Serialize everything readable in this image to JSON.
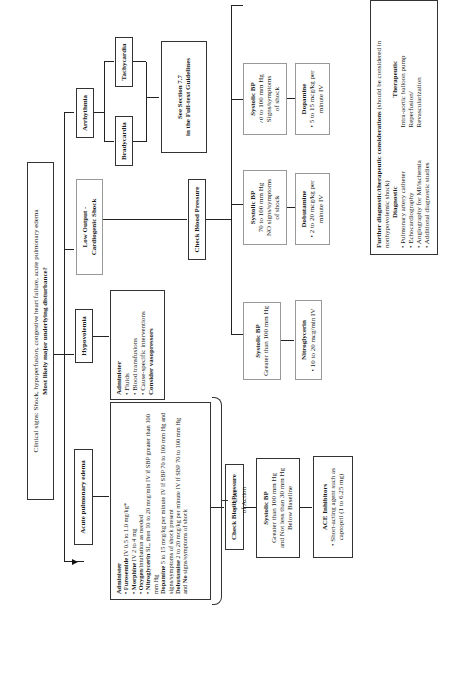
{
  "clinical_signs": {
    "line1": "Clinical signs: Shock, hypoperfusion, congestive heart failure, acute pulmonary edema",
    "line2": "Most likely major underlying disturbance?"
  },
  "branches": {
    "acute_pulmonary_edema": "Acute pulmonary edema",
    "hypovolemia": "Hypovolemia",
    "low_output": {
      "line1": "Low Output -",
      "line2": "Cardiogenic Shock"
    },
    "arrhythmia": "Arrhythmia",
    "bradycardia": "Bradycardia",
    "tachycardia": "Tachycardia",
    "see_section": {
      "line1": "See Section 7.7",
      "line2": "in the Full-text Guidelines"
    }
  },
  "hypovolemia_admin": {
    "title": "Administer",
    "items": [
      "Fluids",
      "Blood transfusions",
      "Cause-specific interventions"
    ],
    "consider": "Consider vasopressors"
  },
  "ape_admin": {
    "title": "Administer",
    "items": [
      {
        "bold": "Furosemide",
        "text": " IV 0.5 to 1.0 mg/kg*"
      },
      {
        "bold": "Morphine",
        "text": " IV 2 to 4 mg"
      },
      {
        "bold": "Oxygen",
        "text": "/intubation as needed"
      },
      {
        "bold": "Nitroglycerin",
        "text": " SL, then 10 to 20 mcg/min IV if SBP greater than 100 mm Hg"
      }
    ],
    "dopamine": {
      "bold": "Dopamine",
      "text": " 5 to 15 mcg/kg per minute IV if SBP 70 to 100 mm Hg and signs/symptoms of shock present"
    },
    "dobutamine": {
      "bold": "Dobutamine",
      "text": " 2 to 20 mcg/kg per minute IV if SBP 70 to 100 mm Hg and ",
      "bold2": "No",
      "text2": " signs/symptoms of shock"
    }
  },
  "check_bp_ape": "Check Blood Pressure",
  "check_bp_cardio": "Check Blood Pressure",
  "ape_sbp": {
    "title": "Systolic BP",
    "line1": "Greater than 100 mm Hg",
    "line2": "and Not less than 30 mm Hg",
    "line3": "Below Baseline"
  },
  "ace": {
    "title": "ACE Inhibitors",
    "item": "Short-acting agent such as captopril (1 to 6.25 mg)"
  },
  "sbp_boxes": [
    {
      "title": "Systolic BP",
      "line1": "Greater than 100 mm Hg",
      "line2": "",
      "line3": ""
    },
    {
      "title": "Systolic BP",
      "line1": "70 to 100 mm Hg",
      "line2": "NO signs/symptoms",
      "line3": "of shock"
    },
    {
      "title": "Systolic BP",
      "line1": "70 to 100 mm Hg",
      "line2": "Signs/symptoms",
      "line3": "of shock"
    },
    {
      "title": "Systolic BP",
      "line1": "Less than 70 mm Hg",
      "line2": "Signs/symptoms of",
      "line3": "shock"
    }
  ],
  "drug_boxes": [
    {
      "title": "Nitroglycerin",
      "item": "10 to 20 mcg/min IV"
    },
    {
      "title": "Dobutamine",
      "item": "2 to 20 mcg/kg per minute IV"
    },
    {
      "title": "Dopamine",
      "item": "5 to 15 mcg/kg per minute IV"
    },
    {
      "title": "Norepinephrine",
      "item": "0.5 to 30 mcg/min IV"
    }
  ],
  "further": {
    "title": "Further diagnostic/therapeutic considerations",
    "subtitle": " (should be considered in nonhypovolemic shock)",
    "diagnostic_title": "Diagnostic",
    "diagnostic": [
      "Pulmonary artery catheter",
      "Echocardiography",
      "Angiography for MI/ischemia",
      "Additional diagnostic studies"
    ],
    "therapeutic_title": "Therapeutic",
    "therapeutic": [
      "Intra-aortic balloon pump",
      "Reperfusion/",
      "Revascularization"
    ]
  },
  "lines_of_action": [
    {
      "num": "1",
      "sup": "st",
      "line": " Line",
      "of": "of Action"
    },
    {
      "num": "2",
      "sup": "nd",
      "line": " Line",
      "of": "of Action"
    },
    {
      "num": "3",
      "sup": "rd",
      "line": " Line",
      "of": "of Action"
    }
  ]
}
